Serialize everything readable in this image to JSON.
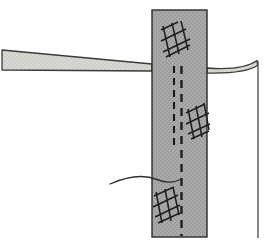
{
  "figure": {
    "type": "engineering-section-drawing",
    "width": 275,
    "height": 250,
    "background_color": "#ffffff"
  },
  "colors": {
    "column_fill": "#a8a8a8",
    "column_fill_light": "#b4b4b4",
    "beam_fill": "#d4d4d0",
    "outline": "#2a2a2a",
    "line": "#3a3a3a",
    "hatch": "#1e1e1e",
    "dash": "#1a1a1a"
  },
  "elements": {
    "column": {
      "label": "vertical-column",
      "fill": "#a8a8a8",
      "x": 152,
      "y": 10,
      "width": 55,
      "height": 227,
      "stroke_width": 1.4
    },
    "left_beam": {
      "label": "left-tapered-beam",
      "fill": "#d4d4d0",
      "points": "2,50 152,64 152,71 2,70",
      "stroke_width": 1.3
    },
    "right_beam": {
      "label": "right-tapered-beam",
      "fill": "#d4d4d0",
      "path": "M 207,68 C 230,69 248,68 258,61 L 258,66 C 248,72 230,73 207,73 Z",
      "stroke_width": 1.3
    },
    "right_vertical_line": {
      "label": "right-vertical-reference-line",
      "x": 258,
      "y1": 61,
      "y2": 238,
      "stroke_width": 1.3
    },
    "curved_wire": {
      "label": "curved-reinforcement-wire",
      "path": "M 110,184 C 128,176 142,174 158,180 C 168,183 176,182 182,179",
      "stroke_width": 1.3
    },
    "dashed_lines": [
      {
        "label": "dashed-line-inner-left",
        "x": 174,
        "y1": 66,
        "y2": 150,
        "dash": "7,5"
      },
      {
        "label": "dashed-line-inner-right",
        "x": 181,
        "y1": 66,
        "y2": 236,
        "dash": "8,6"
      }
    ],
    "hatch_groups": [
      {
        "label": "hatch-top",
        "x": 158,
        "y": 22,
        "w": 32,
        "h": 36,
        "lines": 3,
        "slant": 14
      },
      {
        "label": "hatch-middle",
        "x": 184,
        "y": 103,
        "w": 28,
        "h": 36,
        "lines": 3,
        "slant": 14
      },
      {
        "label": "hatch-bottom",
        "x": 152,
        "y": 186,
        "w": 30,
        "h": 38,
        "lines": 3,
        "slant": 14
      }
    ]
  },
  "annotations": {
    "column_name": "column",
    "left_beam_name": "beam-left",
    "right_beam_name": "beam-right",
    "hatch_name": "cross-hatch-rebar-mesh",
    "dash_name": "hidden-edge-dashed-line",
    "wire_name": "curved-wire"
  }
}
